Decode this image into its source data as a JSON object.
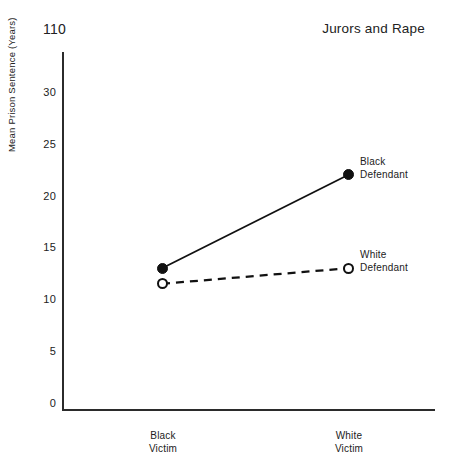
{
  "header": {
    "page_number": "110",
    "running_head": "Jurors and Rape"
  },
  "chart_data": {
    "type": "line",
    "title": "",
    "xlabel": "",
    "ylabel": "Mean Prison Sentence (Years)",
    "categories": [
      "Black\nVictim",
      "White\nVictim"
    ],
    "category_labels": [
      {
        "line1": "Black",
        "line2": "Victim"
      },
      {
        "line1": "White",
        "line2": "Victim"
      }
    ],
    "ylim": [
      0,
      32
    ],
    "yticks": [
      0,
      5,
      10,
      15,
      20,
      25,
      30
    ],
    "ytick_labels": [
      "0",
      "5",
      "10",
      "15",
      "20",
      "25",
      "30"
    ],
    "grid": false,
    "legend_position": "right-of-endpoints",
    "series": [
      {
        "name": "Black Defendant",
        "label_line1": "Black",
        "label_line2": "Defendant",
        "values": [
          13,
          22
        ],
        "linestyle": "solid",
        "marker": "filled-circle",
        "color": "#111111"
      },
      {
        "name": "White Defendant",
        "label_line1": "White",
        "label_line2": "Defendant",
        "values": [
          11.5,
          13
        ],
        "linestyle": "dashed",
        "marker": "open-circle",
        "color": "#111111"
      }
    ],
    "annotations": [
      {
        "text": "Black Defendant",
        "attached_to": "series.0.endpoint"
      },
      {
        "text": "White Defendant",
        "attached_to": "series.1.endpoint"
      }
    ]
  }
}
